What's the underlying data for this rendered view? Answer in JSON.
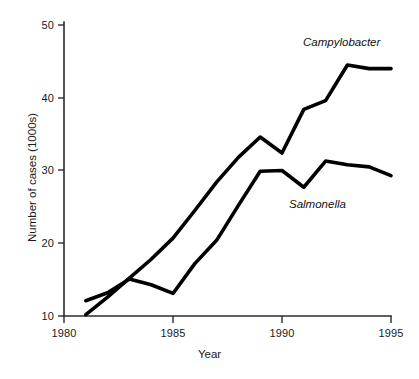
{
  "chart_data": {
    "type": "line",
    "title": "",
    "xlabel": "Year",
    "ylabel": "Number of cases (1000s)",
    "xlim": [
      1980,
      1995
    ],
    "ylim": [
      10,
      50
    ],
    "xticks": [
      1980,
      1985,
      1990,
      1995
    ],
    "yticks": [
      10,
      20,
      30,
      40,
      50
    ],
    "xtick_labels": [
      "1980",
      "1985",
      "1990",
      "1995"
    ],
    "ytick_labels": [
      "10",
      "20",
      "30",
      "40",
      "50"
    ],
    "grid": false,
    "legend_position": "inline-annotations",
    "x": [
      1981,
      1982,
      1983,
      1984,
      1985,
      1986,
      1987,
      1988,
      1989,
      1990,
      1991,
      1992,
      1993,
      1994,
      1995
    ],
    "series": [
      {
        "name": "Campylobacter",
        "values": [
          10.2,
          12.6,
          15.2,
          17.8,
          20.7,
          24.5,
          28.4,
          31.8,
          34.6,
          32.4,
          38.4,
          39.6,
          44.5,
          44.0,
          44.0
        ],
        "x": [
          1981,
          1982,
          1983,
          1984,
          1985,
          1986,
          1987,
          1988,
          1989,
          1990,
          1991,
          1992,
          1993,
          1994,
          1995
        ],
        "color": "#000000",
        "label_text": "Campylobacter"
      },
      {
        "name": "Salmonella",
        "values": [
          12.1,
          13.2,
          15.1,
          14.3,
          13.1,
          17.2,
          20.4,
          25.2,
          29.9,
          30.0,
          27.7,
          31.3,
          30.8,
          30.5,
          29.3
        ],
        "x": [
          1981,
          1982,
          1983,
          1984,
          1985,
          1986,
          1987,
          1988,
          1989,
          1990,
          1991,
          1992,
          1993,
          1994,
          1995
        ],
        "color": "#000000",
        "label_text": "Salmonella"
      }
    ],
    "annotations": [
      {
        "text": "Campylobacter",
        "x": 1993.2,
        "y": 47.0,
        "style": "italic"
      },
      {
        "text": "Salmonella",
        "x": 1991.4,
        "y": 25.6,
        "style": "italic"
      }
    ]
  },
  "labels": {
    "xaxis_title": "Year",
    "yaxis_title": "Number of cases (1000s)",
    "campylobacter": "Campylobacter",
    "salmonella": "Salmonella",
    "y_10": "10",
    "y_20": "20",
    "y_30": "30",
    "y_40": "40",
    "y_50": "50",
    "x_1980": "1980",
    "x_1985": "1985",
    "x_1990": "1990",
    "x_1995": "1995"
  },
  "colors": {
    "series_stroke": "#000000",
    "axis": "#2b2b2b",
    "background": "#ffffff",
    "text": "#1a1a1a"
  }
}
